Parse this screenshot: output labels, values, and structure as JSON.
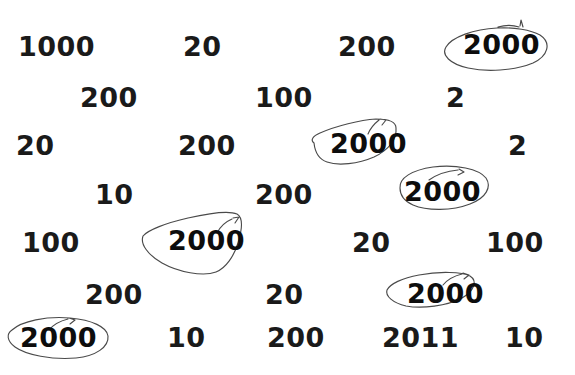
{
  "worksheet": {
    "background_color": "#ffffff",
    "ink_color": "#4a4a4a",
    "text_color": "#1a1a1a",
    "target_value": "2000",
    "numbers": [
      {
        "label": "1000",
        "x": 18,
        "y": 33,
        "circled": false
      },
      {
        "label": "20",
        "x": 183,
        "y": 33,
        "circled": false
      },
      {
        "label": "200",
        "x": 338,
        "y": 33,
        "circled": false
      },
      {
        "label": "2000",
        "x": 463,
        "y": 31,
        "circled": true
      },
      {
        "label": "200",
        "x": 80,
        "y": 84,
        "circled": false
      },
      {
        "label": "100",
        "x": 255,
        "y": 84,
        "circled": false
      },
      {
        "label": "2",
        "x": 446,
        "y": 84,
        "circled": false
      },
      {
        "label": "20",
        "x": 16,
        "y": 132,
        "circled": false
      },
      {
        "label": "200",
        "x": 178,
        "y": 132,
        "circled": false
      },
      {
        "label": "2000",
        "x": 330,
        "y": 130,
        "circled": true
      },
      {
        "label": "2",
        "x": 508,
        "y": 132,
        "circled": false
      },
      {
        "label": "10",
        "x": 95,
        "y": 181,
        "circled": false
      },
      {
        "label": "200",
        "x": 255,
        "y": 181,
        "circled": false
      },
      {
        "label": "2000",
        "x": 404,
        "y": 178,
        "circled": true
      },
      {
        "label": "100",
        "x": 22,
        "y": 229,
        "circled": false
      },
      {
        "label": "2000",
        "x": 168,
        "y": 227,
        "circled": true
      },
      {
        "label": "20",
        "x": 352,
        "y": 229,
        "circled": false
      },
      {
        "label": "100",
        "x": 486,
        "y": 229,
        "circled": false
      },
      {
        "label": "200",
        "x": 85,
        "y": 281,
        "circled": false
      },
      {
        "label": "20",
        "x": 265,
        "y": 281,
        "circled": false
      },
      {
        "label": "2000",
        "x": 407,
        "y": 280,
        "circled": true
      },
      {
        "label": "2000",
        "x": 20,
        "y": 324,
        "circled": true
      },
      {
        "label": "10",
        "x": 167,
        "y": 324,
        "circled": false
      },
      {
        "label": "200",
        "x": 267,
        "y": 324,
        "circled": false
      },
      {
        "label": "2011",
        "x": 382,
        "y": 324,
        "circled": false
      },
      {
        "label": "10",
        "x": 505,
        "y": 324,
        "circled": false
      }
    ],
    "circles": [
      {
        "name": "circle-2000-row1",
        "d": "M 540 35 C 552 43 548 56 533 63 C 514 71 486 72 468 68 C 450 64 441 55 446 47 C 452 37 474 29 497 28 C 514 27 531 30 540 35 M 519 27 C 513 25 505 25 498 27 M 520 26 L 521 20 L 523 27"
      },
      {
        "name": "circle-2000-row3",
        "d": "M 314 143 C 310 140 313 136 320 133 C 336 126 360 120 376 119 C 388 119 396 122 396 128 C 397 139 389 150 374 157 C 358 164 338 166 327 162 C 318 159 315 152 314 143 M 379 120 C 374 124 370 129 368 134 M 380 119 L 386 120 L 382 125"
      },
      {
        "name": "circle-2000-row4",
        "d": "M 400 188 C 399 178 412 170 433 167 C 456 164 479 169 486 178 C 492 187 486 198 470 204 C 452 211 427 211 413 205 C 404 201 400 195 400 188 M 458 170 C 447 171 436 175 429 180 M 459 169 L 464 172 L 458 175"
      },
      {
        "name": "circle-2000-row5",
        "d": "M 143 236 C 148 230 166 223 188 218 C 210 213 230 211 237 214 C 244 218 242 230 238 243 C 234 256 226 268 216 272 C 203 277 178 272 162 263 C 148 255 140 244 143 236 M 232 219 C 225 222 220 227 217 233 M 233 218 L 239 217 L 235 223"
      },
      {
        "name": "circle-2000-row6",
        "d": "M 387 290 C 390 284 402 278 419 275 C 440 271 462 272 470 276 C 478 281 474 291 462 298 C 447 306 422 309 406 306 C 393 303 385 296 387 290 M 462 274 C 454 276 447 280 443 285 M 463 273 L 469 275 L 464 279"
      },
      {
        "name": "circle-2000-row7",
        "d": "M 12 330 C 22 321 46 316 70 318 C 92 320 107 327 108 336 C 109 347 96 356 76 358 C 52 360 26 355 15 347 C 7 341 6 334 12 330 M 68 319 C 60 321 53 325 49 330 M 69 318 L 75 320 L 70 324"
      }
    ]
  }
}
